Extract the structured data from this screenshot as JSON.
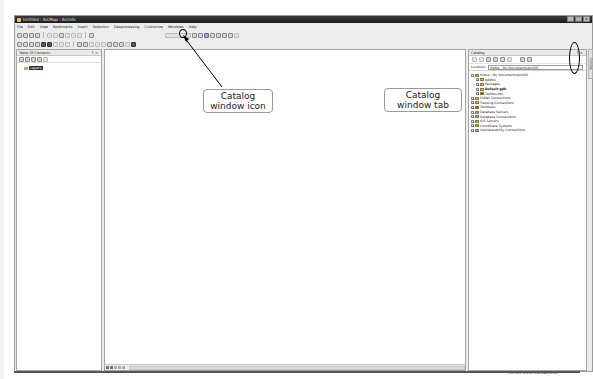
{
  "window": {
    "title": "Untitled - ArcMap - ArcInfo",
    "controls": [
      "minimize",
      "maximize",
      "close"
    ]
  },
  "menubar": {
    "items": [
      "File",
      "Edit",
      "View",
      "Bookmarks",
      "Insert",
      "Selection",
      "Geoprocessing",
      "Customize",
      "Windows",
      "Help"
    ]
  },
  "toc": {
    "title": "Table Of Contents",
    "pin": "↑ ×",
    "root_layer": "Layers"
  },
  "catalog": {
    "title": "Catalog",
    "pin": "↑ ×",
    "location_label": "Location:",
    "location_value": "Home - My Documents\\ArcGIS",
    "tree": [
      {
        "label": "Home - My Documents\\ArcGIS",
        "level": 0,
        "expander": "−"
      },
      {
        "label": "AddIns",
        "level": 1,
        "expander": "+"
      },
      {
        "label": "Packages",
        "level": 1,
        "expander": "+"
      },
      {
        "label": "Default.gdb",
        "level": 1,
        "expander": "+",
        "bold": true
      },
      {
        "label": "Toolbox.tbx",
        "level": 1,
        "expander": "+"
      },
      {
        "label": "Folder Connections",
        "level": 0,
        "expander": "+"
      },
      {
        "label": "Tracking Connections",
        "level": 0,
        "expander": "+"
      },
      {
        "label": "Toolboxes",
        "level": 0,
        "expander": "+"
      },
      {
        "label": "Database Servers",
        "level": 0,
        "expander": "+"
      },
      {
        "label": "Database Connections",
        "level": 0,
        "expander": "+"
      },
      {
        "label": "GIS Servers",
        "level": 0,
        "expander": "+"
      },
      {
        "label": "Coordinate Systems",
        "level": 0,
        "expander": "+"
      },
      {
        "label": "Interoperability Connections",
        "level": 0,
        "expander": "+"
      }
    ],
    "side_tab_label": "Catalog"
  },
  "statusbar": {
    "coordinates": "193.622  6.439 Unknown Units"
  },
  "annotations": {
    "catalog_icon": "Catalog window icon",
    "catalog_tab": "Catalog window tab"
  }
}
